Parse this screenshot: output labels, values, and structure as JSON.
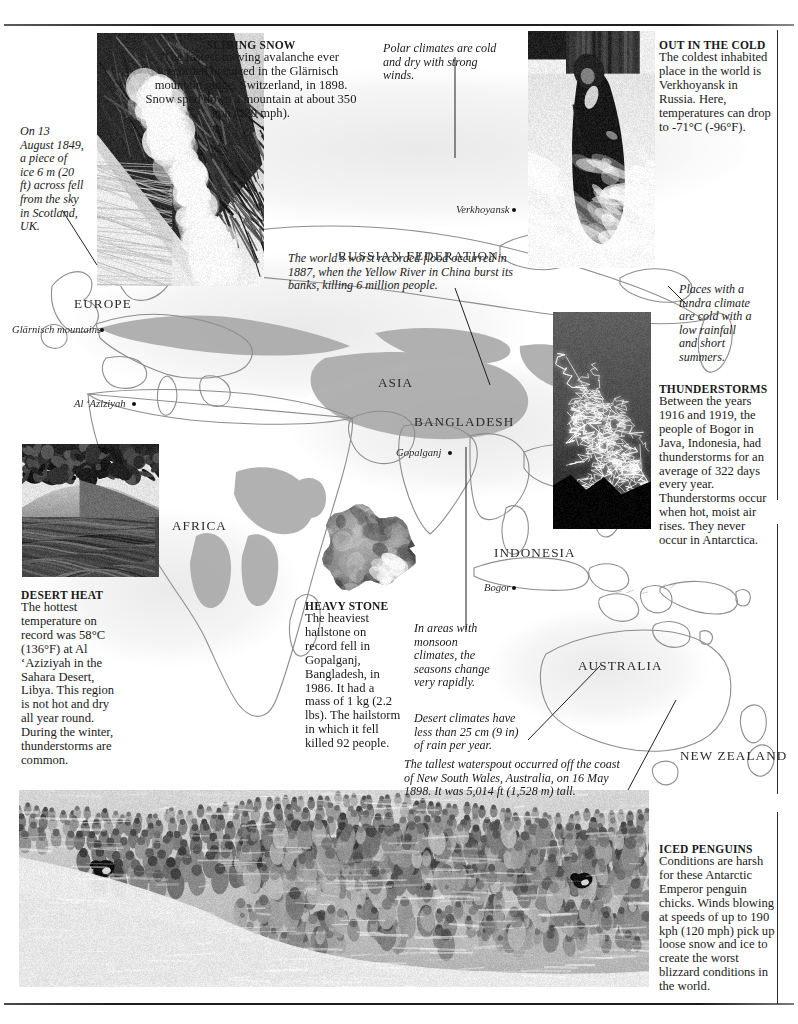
{
  "page": {
    "background_color": "#ffffff",
    "rule_color": "#2a2a2a"
  },
  "captions": [
    {
      "id": "sliding-snow",
      "heading": "SLIDING SNOW",
      "body": "The fastest-moving avalanche ever recorded occurred in the Glärnisch mountain range, Switzerland, in 1898. Snow sped down a mountain at about 350 kph (220 mph)."
    },
    {
      "id": "out-in-the-cold",
      "heading": "OUT IN THE COLD",
      "body": "The coldest inhabited place in the world is Verkhoyansk in Russia. Here, temperatures can drop to -71°C (-96°F)."
    },
    {
      "id": "thunderstorms",
      "heading": "THUNDERSTORMS",
      "body": "Between the years 1916 and 1919, the people of Bogor in Java, Indonesia, had thunderstorms for an average of 322 days every year. Thunderstorms occur when hot, moist air rises. They never occur in Antarctica."
    },
    {
      "id": "desert-heat",
      "heading": "DESERT HEAT",
      "body": "The hottest temperature on record was 58°C (136°F) at Al ‘Aziziyah in the Sahara Desert, Libya. This region is not hot and dry all year round. During the winter, thunderstorms are common."
    },
    {
      "id": "heavy-stone",
      "heading": "HEAVY STONE",
      "body": "The heaviest hailstone on record fell in Gopalganj, Bangladesh, in 1986. It had a mass of 1 kg (2.2 lbs). The hailstorm in which it fell killed 92 people."
    },
    {
      "id": "iced-penguins",
      "heading": "ICED PENGUINS",
      "body": "Conditions are harsh for these Antarctic Emperor penguin chicks. Winds blowing at speeds of up to 190 kph (120 mph) pick up loose snow and ice to create the worst blizzard conditions in the world."
    }
  ],
  "annotations": [
    {
      "id": "scotland-ice",
      "text": "On 13 August 1849, a piece of ice 6 m (20 ft) across fell from the sky in Scotland, UK."
    },
    {
      "id": "polar-climates",
      "text": "Polar climates are cold and dry with strong winds."
    },
    {
      "id": "yellow-river",
      "text": "The world's worst recorded flood occurred in 1887, when the Yellow River in China burst its banks, killing 6 million people."
    },
    {
      "id": "tundra",
      "text": "Places with a tundra climate are cold with a low rainfall and short summers."
    },
    {
      "id": "monsoon",
      "text": "In areas with monsoon climates, the seasons change very rapidly."
    },
    {
      "id": "desert-rain",
      "text": "Desert climates have less than 25 cm (9 in) of rain per year."
    },
    {
      "id": "waterspout",
      "text": "The tallest waterspout occurred off the coast of New South Wales, Australia, on 16 May 1898. It was 5,014 ft (1,528 m) tall."
    }
  ],
  "map_labels": {
    "regions": [
      {
        "id": "europe",
        "name": "EUROPE"
      },
      {
        "id": "russia",
        "name": "RUSSIAN FEDERATION"
      },
      {
        "id": "asia",
        "name": "ASIA"
      },
      {
        "id": "bangladesh",
        "name": "BANGLADESH"
      },
      {
        "id": "africa",
        "name": "AFRICA"
      },
      {
        "id": "indonesia",
        "name": "INDONESIA"
      },
      {
        "id": "australia",
        "name": "AUSTRALIA"
      },
      {
        "id": "newzealand",
        "name": "NEW ZEALAND"
      }
    ],
    "cities": [
      {
        "id": "glarnisch",
        "name": "Glärnisch mountains"
      },
      {
        "id": "al-aziziyah",
        "name": "Al ‘Aziziyah"
      },
      {
        "id": "verkhoyansk",
        "name": "Verkhoyansk"
      },
      {
        "id": "gopalganj",
        "name": "Gopalganj"
      },
      {
        "id": "bogor",
        "name": "Bogor"
      }
    ]
  },
  "photos": [
    {
      "id": "avalanche",
      "alt": "Avalanche sliding down a dark mountain face"
    },
    {
      "id": "verkhoyansk",
      "alt": "Person in thick fur coat walking through deep snow"
    },
    {
      "id": "lightning",
      "alt": "Forked lightning bolts in a night sky"
    },
    {
      "id": "desert",
      "alt": "Rippled desert sand dunes with dark rocks"
    },
    {
      "id": "hailstone",
      "alt": "Large irregular hailstone"
    },
    {
      "id": "penguins",
      "alt": "Huddle of emperor penguin chicks in a blizzard"
    }
  ]
}
